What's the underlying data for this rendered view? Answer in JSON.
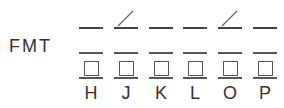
{
  "label": "FMT",
  "columns": [
    {
      "letter": "H",
      "x": 79,
      "diagonal": false
    },
    {
      "letter": "J",
      "x": 114,
      "diagonal": true
    },
    {
      "letter": "K",
      "x": 149,
      "diagonal": false
    },
    {
      "letter": "L",
      "x": 183,
      "diagonal": false
    },
    {
      "letter": "O",
      "x": 218,
      "diagonal": true
    },
    {
      "letter": "P",
      "x": 253,
      "diagonal": false
    }
  ]
}
